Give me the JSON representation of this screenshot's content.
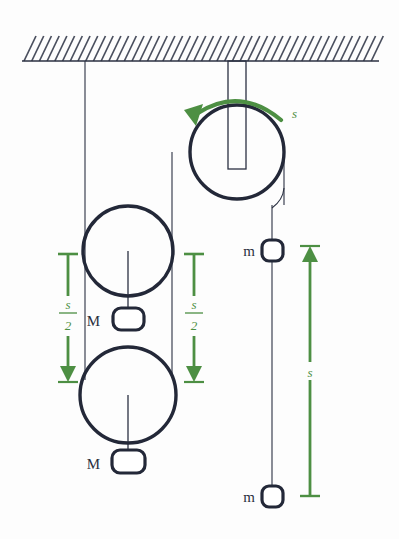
{
  "figure": {
    "colors": {
      "rope": "#2b3142",
      "outline": "#232838",
      "accent_green": "#4d8f43",
      "background": "#fdfdfd",
      "hatch": "#4a4f5e"
    }
  },
  "ceiling": {
    "name": "hatched-ceiling",
    "hatch_count": 46
  },
  "pulleys": [
    {
      "id": "fixed-top",
      "cx": 237,
      "cy": 152,
      "r": 47,
      "has_hanger": true
    },
    {
      "id": "movable-upper-left",
      "cx": 128,
      "cy": 251,
      "r": 45,
      "has_hanger": false
    },
    {
      "id": "movable-lower-left",
      "cx": 128,
      "cy": 395,
      "r": 48,
      "has_hanger": false
    }
  ],
  "masses": [
    {
      "id": "mass-M-upper",
      "label": "M",
      "cx": 128,
      "cy": 319,
      "w": 30,
      "h": 21
    },
    {
      "id": "mass-M-lower",
      "label": "M",
      "cx": 128,
      "cy": 461,
      "w": 32,
      "h": 22
    },
    {
      "id": "mass-m-upper",
      "label": "m",
      "cx": 272,
      "cy": 250,
      "w": 21,
      "h": 21
    },
    {
      "id": "mass-m-lower",
      "label": "m",
      "cx": 272,
      "cy": 496,
      "w": 21,
      "h": 21
    }
  ],
  "displacement_arrows": [
    {
      "id": "arrow-left-s-over-2",
      "label_numerator": "s",
      "label_denominator": "2",
      "label_text": "s/2",
      "direction": "down",
      "x": 68,
      "y_top": 253,
      "y_bottom": 380,
      "cap_top": true,
      "cap_bottom": false
    },
    {
      "id": "arrow-middle-s-over-2",
      "label_numerator": "s",
      "label_denominator": "2",
      "label_text": "s/2",
      "direction": "down",
      "x": 194,
      "y_top": 253,
      "y_bottom": 380,
      "cap_top": true,
      "cap_bottom": true
    },
    {
      "id": "arrow-right-s",
      "label_numerator": "s",
      "label_denominator": "",
      "label_text": "s",
      "direction": "up",
      "x": 310,
      "y_top": 248,
      "y_bottom": 497,
      "cap_top": false,
      "cap_bottom": true
    }
  ],
  "rotation_arrow": {
    "id": "rotation-arc-arrow",
    "label": "s",
    "direction": "counter-clockwise",
    "label_x": 292,
    "label_y": 115
  },
  "ropes": [
    {
      "id": "rope-ceiling-to-left-pulley-left",
      "x": 85,
      "y_top": 61,
      "y_bottom": 380
    },
    {
      "id": "rope-top-pulley-left-to-left-pulley-right",
      "x": 172,
      "y_top": 152,
      "y_bottom": 378
    },
    {
      "id": "rope-top-pulley-right-to-masses-m",
      "x": 272,
      "y_top": 152,
      "y_bottom": 496
    },
    {
      "id": "rope-upper-left-pulley-center-to-M",
      "x": 128,
      "y_top": 251,
      "y_bottom": 319
    },
    {
      "id": "rope-lower-left-pulley-center-to-M",
      "x": 128,
      "y_top": 395,
      "y_bottom": 461
    },
    {
      "id": "rope-upper-M-to-lower-pulley",
      "x": 128,
      "y_top": 319,
      "y_bottom": 347
    }
  ]
}
